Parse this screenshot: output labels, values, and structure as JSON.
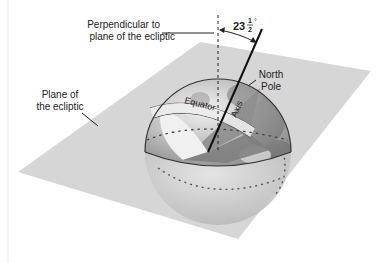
{
  "diagram": {
    "labels": {
      "perpendicular_line1": "Perpendicular to",
      "perpendicular_line2": "plane of the ecliptic",
      "angle_whole": "23",
      "angle_num": "1",
      "angle_den": "2",
      "angle_degree": "°",
      "plane_line1": "Plane of",
      "plane_line2": "the ecliptic",
      "north_line1": "North",
      "north_line2": "Pole",
      "equator": "Equator",
      "axis": "Axis"
    },
    "colors": {
      "plane": "#d6d6d6",
      "globe_light": "#e2e2e2",
      "globe_dark": "#8a8a8a",
      "cutaway": "#9a9a9a",
      "line": "#111111"
    },
    "tilt_angle_deg": 23.5
  }
}
